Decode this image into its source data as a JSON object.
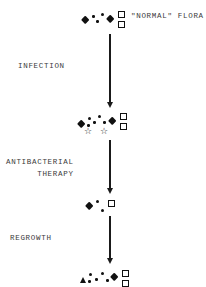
{
  "figure": {
    "title_text": "\"NORMAL\" FLORA",
    "axis_x": 110,
    "stages": [
      {
        "id": "normal-flora",
        "label": "\"NORMAL\" FLORA",
        "label_x": 131,
        "label_y": 12,
        "cluster_y": 10,
        "cluster_x": 82,
        "glyphs": [
          {
            "shape": "diamond",
            "x": 0,
            "y": 7,
            "size": 9
          },
          {
            "shape": "dot",
            "x": 10,
            "y": 5,
            "size": 2.5
          },
          {
            "shape": "dot",
            "x": 14,
            "y": 10,
            "size": 2.5
          },
          {
            "shape": "dot",
            "x": 19,
            "y": 3,
            "size": 3
          },
          {
            "shape": "diamond",
            "x": 25,
            "y": 6,
            "size": 9
          },
          {
            "shape": "square",
            "x": 36,
            "y": 1,
            "size": 7
          },
          {
            "shape": "square",
            "x": 36,
            "y": 11,
            "size": 7
          }
        ]
      },
      {
        "id": "infection",
        "label": "INFECTION",
        "label_x": 18,
        "label_y": 60,
        "cluster_y": 112,
        "cluster_x": 78,
        "glyphs": [
          {
            "shape": "diamond",
            "x": 0,
            "y": 9,
            "size": 9
          },
          {
            "shape": "dot",
            "x": 10,
            "y": 5,
            "size": 3
          },
          {
            "shape": "dot",
            "x": 9,
            "y": 12,
            "size": 2.5
          },
          {
            "shape": "dot",
            "x": 15,
            "y": 9,
            "size": 2.5
          },
          {
            "shape": "dot",
            "x": 20,
            "y": 3,
            "size": 3
          },
          {
            "shape": "dot",
            "x": 25,
            "y": 9,
            "size": 2.5
          },
          {
            "shape": "diamond",
            "x": 31,
            "y": 6,
            "size": 9
          },
          {
            "shape": "square",
            "x": 42,
            "y": 1,
            "size": 7
          },
          {
            "shape": "square",
            "x": 42,
            "y": 11,
            "size": 7
          },
          {
            "shape": "star",
            "x": 6,
            "y": 15,
            "size": 9
          },
          {
            "shape": "star",
            "x": 22,
            "y": 15,
            "size": 9
          }
        ]
      },
      {
        "id": "antibacterial-therapy",
        "label": "ANTIBACTERIAL\nTHERAPY",
        "label_line1": "ANTIBACTERIAL",
        "label_line2": "THERAPY",
        "label_x": 6,
        "label_y": 156,
        "cluster_y": 198,
        "cluster_x": 86,
        "glyphs": [
          {
            "shape": "diamond",
            "x": 0,
            "y": 5,
            "size": 9
          },
          {
            "shape": "dot",
            "x": 10,
            "y": 2,
            "size": 3
          },
          {
            "shape": "dot",
            "x": 15,
            "y": 11,
            "size": 3
          },
          {
            "shape": "square",
            "x": 22,
            "y": 2,
            "size": 7
          }
        ]
      },
      {
        "id": "regrowth",
        "label": "REGROWTH",
        "label_x": 10,
        "label_y": 232,
        "cluster_y": 268,
        "cluster_x": 80,
        "glyphs": [
          {
            "shape": "triangle",
            "x": 0,
            "y": 9,
            "size": 7
          },
          {
            "shape": "dot",
            "x": 9,
            "y": 5,
            "size": 3
          },
          {
            "shape": "dot",
            "x": 8,
            "y": 12,
            "size": 2.5
          },
          {
            "shape": "dot",
            "x": 15,
            "y": 10,
            "size": 2.5
          },
          {
            "shape": "dot",
            "x": 21,
            "y": 4,
            "size": 3
          },
          {
            "shape": "dot",
            "x": 26,
            "y": 11,
            "size": 2.5
          },
          {
            "shape": "diamond",
            "x": 31,
            "y": 6,
            "size": 9
          },
          {
            "shape": "square",
            "x": 42,
            "y": 2,
            "size": 7
          },
          {
            "shape": "square",
            "x": 42,
            "y": 12,
            "size": 7
          }
        ]
      }
    ],
    "arrows": [
      {
        "id": "arrow-infection",
        "x": 110,
        "y_top": 34,
        "y_bottom": 108
      },
      {
        "id": "arrow-therapy",
        "x": 110,
        "y_top": 140,
        "y_bottom": 194
      },
      {
        "id": "arrow-regrowth",
        "x": 110,
        "y_top": 216,
        "y_bottom": 264
      }
    ],
    "colors": {
      "ink": "#111111",
      "text": "#3a3a3a",
      "background": "#ffffff"
    }
  }
}
